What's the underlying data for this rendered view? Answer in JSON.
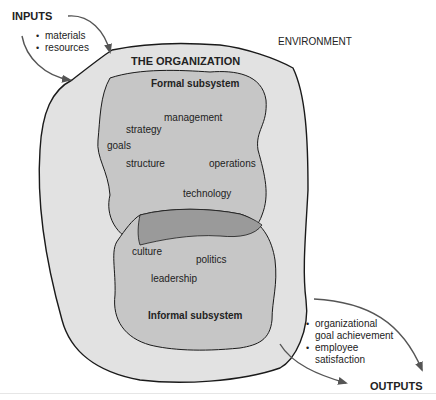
{
  "colors": {
    "organization_fill": "#e2e2e2",
    "subsystem_fill": "#c6c6c6",
    "overlap_fill": "#9a9a9a",
    "outline": "#1a1a1a",
    "arrow": "#555555"
  },
  "inputs": {
    "title": "INPUTS",
    "items": [
      "materials",
      "resources"
    ]
  },
  "environment": {
    "label": "ENVIRONMENT"
  },
  "organization": {
    "title": "THE ORGANIZATION"
  },
  "formal_subsystem": {
    "title": "Formal subsystem",
    "elements": [
      "management",
      "strategy",
      "goals",
      "structure",
      "operations",
      "technology"
    ]
  },
  "informal_subsystem": {
    "title": "Informal subsystem",
    "elements": [
      "culture",
      "politics",
      "leadership"
    ]
  },
  "outputs": {
    "title": "OUTPUTS",
    "items": [
      {
        "line1": "organizational",
        "line2": "goal achievement"
      },
      {
        "line1": "employee",
        "line2": "satisfaction"
      }
    ]
  }
}
